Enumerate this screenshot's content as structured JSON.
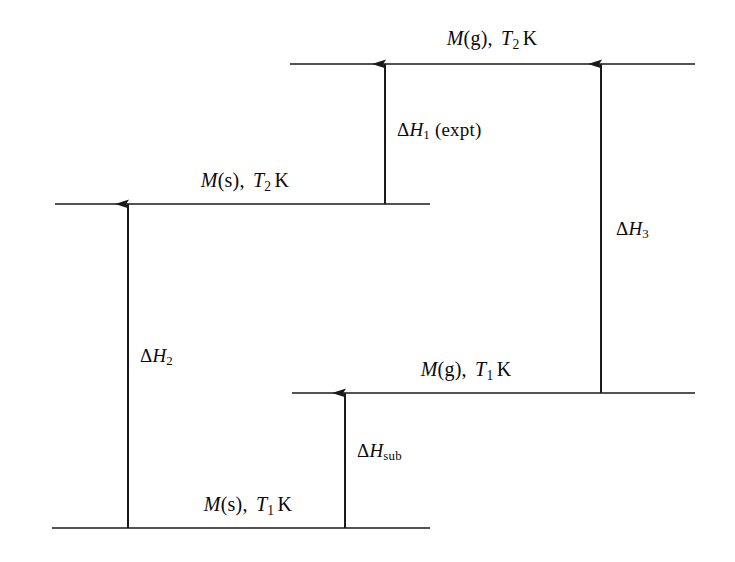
{
  "diagram": {
    "background_color": "#ffffff",
    "line_color": "#1a1a1a",
    "text_color": "#0a0a0a",
    "width": 735,
    "height": 562,
    "levels": [
      {
        "id": "level-mg-t2",
        "label_plain": "M(g), T2 K",
        "species": "M",
        "phase": "(g)",
        "temperature_symbol": "T",
        "temperature_subscript": "2",
        "temperature_unit": "K",
        "line_y": 64,
        "line_x1": 290,
        "line_x2": 695,
        "label_x": 492,
        "label_y": 38
      },
      {
        "id": "level-ms-t2",
        "label_plain": "M(s), T2 K",
        "species": "M",
        "phase": "(s)",
        "temperature_symbol": "T",
        "temperature_subscript": "2",
        "temperature_unit": "K",
        "line_y": 204,
        "line_x1": 55,
        "line_x2": 430,
        "label_x": 245,
        "label_y": 180
      },
      {
        "id": "level-mg-t1",
        "label_plain": "M(g), T1 K",
        "species": "M",
        "phase": "(g)",
        "temperature_symbol": "T",
        "temperature_subscript": "1",
        "temperature_unit": "K",
        "line_y": 393,
        "line_x1": 292,
        "line_x2": 695,
        "label_x": 466,
        "label_y": 369
      },
      {
        "id": "level-ms-t1",
        "label_plain": "M(s), T1 K",
        "species": "M",
        "phase": "(s)",
        "temperature_symbol": "T",
        "temperature_subscript": "1",
        "temperature_unit": "K",
        "line_y": 528,
        "line_x1": 52,
        "line_x2": 430,
        "label_x": 248,
        "label_y": 504
      }
    ],
    "arrows": [
      {
        "id": "arrow-delta-h2",
        "label_plain": "ΔH2",
        "delta": "Δ",
        "symbol": "H",
        "subscript": "2",
        "subscript_style": "number",
        "note": "",
        "x": 128,
        "y_from": 528,
        "y_to": 204,
        "direction": "up",
        "label_x": 140,
        "label_y": 355
      },
      {
        "id": "arrow-delta-hsub",
        "label_plain": "ΔHsub",
        "delta": "Δ",
        "symbol": "H",
        "subscript": "sub",
        "subscript_style": "roman",
        "note": "",
        "x": 345,
        "y_from": 528,
        "y_to": 393,
        "direction": "up",
        "label_x": 357,
        "label_y": 450
      },
      {
        "id": "arrow-delta-h1",
        "label_plain": "ΔH1 (expt)",
        "delta": "Δ",
        "symbol": "H",
        "subscript": "1",
        "subscript_style": "number",
        "note": "(expt)",
        "x": 385,
        "y_from": 204,
        "y_to": 64,
        "direction": "up",
        "label_x": 397,
        "label_y": 129
      },
      {
        "id": "arrow-delta-h3",
        "label_plain": "ΔH3",
        "delta": "Δ",
        "symbol": "H",
        "subscript": "3",
        "subscript_style": "number",
        "note": "",
        "x": 601,
        "y_from": 393,
        "y_to": 64,
        "direction": "up",
        "label_x": 616,
        "label_y": 228
      }
    ]
  }
}
